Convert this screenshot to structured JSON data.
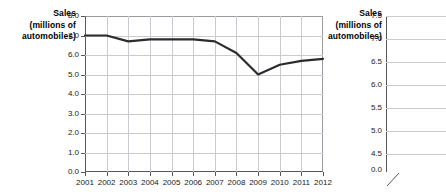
{
  "chart_data": [
    {
      "id": "left",
      "type": "line",
      "title": "",
      "ylabel": "Sales (millions of automobiles)",
      "xlabel": "",
      "categories": [
        "2001",
        "2002",
        "2003",
        "2004",
        "2005",
        "2006",
        "2007",
        "2008",
        "2009",
        "2010",
        "2011",
        "2012"
      ],
      "values": [
        7.0,
        7.0,
        6.7,
        6.8,
        6.8,
        6.8,
        6.7,
        6.1,
        5.0,
        5.5,
        5.7,
        5.8
      ],
      "series": [
        {
          "name": "Sales",
          "values": [
            7.0,
            7.0,
            6.7,
            6.8,
            6.8,
            6.8,
            6.7,
            6.1,
            5.0,
            5.5,
            5.7,
            5.8
          ]
        }
      ],
      "ylim": [
        0.0,
        8.0
      ],
      "yticks": [
        "8.0",
        "7.0",
        "6.0",
        "5.0",
        "4.0",
        "3.0",
        "2.0",
        "1.0",
        "0.0"
      ],
      "ytick_values": [
        8.0,
        7.0,
        6.0,
        5.0,
        4.0,
        3.0,
        2.0,
        1.0,
        0.0
      ],
      "grid": true,
      "legend": "none",
      "line_color": "#2b2b2b"
    },
    {
      "id": "right",
      "type": "line",
      "title": "",
      "ylabel": "Sales (millions of automobiles)",
      "xlabel": "",
      "categories": [
        "2001"
      ],
      "values": [],
      "ylim": [
        4.5,
        7.5
      ],
      "yticks": [
        "7.5",
        "7.0",
        "6.5",
        "6.0",
        "5.5",
        "5.0",
        "4.5",
        "0.0"
      ],
      "ytick_values": [
        7.5,
        7.0,
        6.5,
        6.0,
        5.5,
        5.0,
        4.5,
        0.0
      ],
      "axis_break": true,
      "grid": true,
      "legend": "none",
      "note": "partially visible, cropped at right image edge"
    }
  ],
  "left_chart": {
    "axis_title_line1": "Sales",
    "axis_title_line2": "(millions of",
    "axis_title_line3": "automobiles)",
    "yticks": [
      "8.0",
      "7.0",
      "6.0",
      "5.0",
      "4.0",
      "3.0",
      "2.0",
      "1.0",
      "0.0"
    ],
    "xticks": [
      "2001",
      "2002",
      "2003",
      "2004",
      "2005",
      "2006",
      "2007",
      "2008",
      "2009",
      "2010",
      "2011",
      "2012"
    ]
  },
  "right_chart": {
    "axis_title_line1": "Sales",
    "axis_title_line2": "(millions of",
    "axis_title_line3": "automobiles)",
    "yticks": [
      "7.5",
      "7.0",
      "6.5",
      "6.0",
      "5.5",
      "5.0",
      "4.5",
      "0.0"
    ],
    "xticks": [
      "20"
    ]
  }
}
